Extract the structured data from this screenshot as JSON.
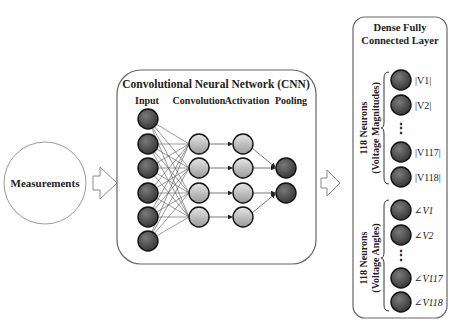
{
  "measurements": {
    "label": "Measurements"
  },
  "cnn": {
    "title": "Convolutional Neural Network (CNN)",
    "layers": [
      {
        "label": "Input",
        "nodes": 6
      },
      {
        "label": "Convolution",
        "nodes": 4
      },
      {
        "label": "Activation",
        "nodes": 4
      },
      {
        "label": "Pooling",
        "nodes": 2
      }
    ]
  },
  "dense": {
    "title_line1": "Dense Fully",
    "title_line2": "Connected Layer",
    "magnitudes": {
      "group_label_line1": "118 Neurons",
      "group_label_line2": "(Voltage Magnitudes)",
      "nodes": [
        "|V1|",
        "|V2|",
        "|V117|",
        "|V118|"
      ],
      "ellipsis": "⋮"
    },
    "angles": {
      "group_label_line1": "118 Neurons",
      "group_label_line2": "(Voltage Angles)",
      "nodes": [
        "∠V1",
        "∠V2",
        "∠V117",
        "∠V118"
      ],
      "ellipsis": "⋮"
    }
  },
  "colors": {
    "dark_node": "#4a4a4a",
    "light_node": "#c8c8c8",
    "border": "#555555"
  }
}
